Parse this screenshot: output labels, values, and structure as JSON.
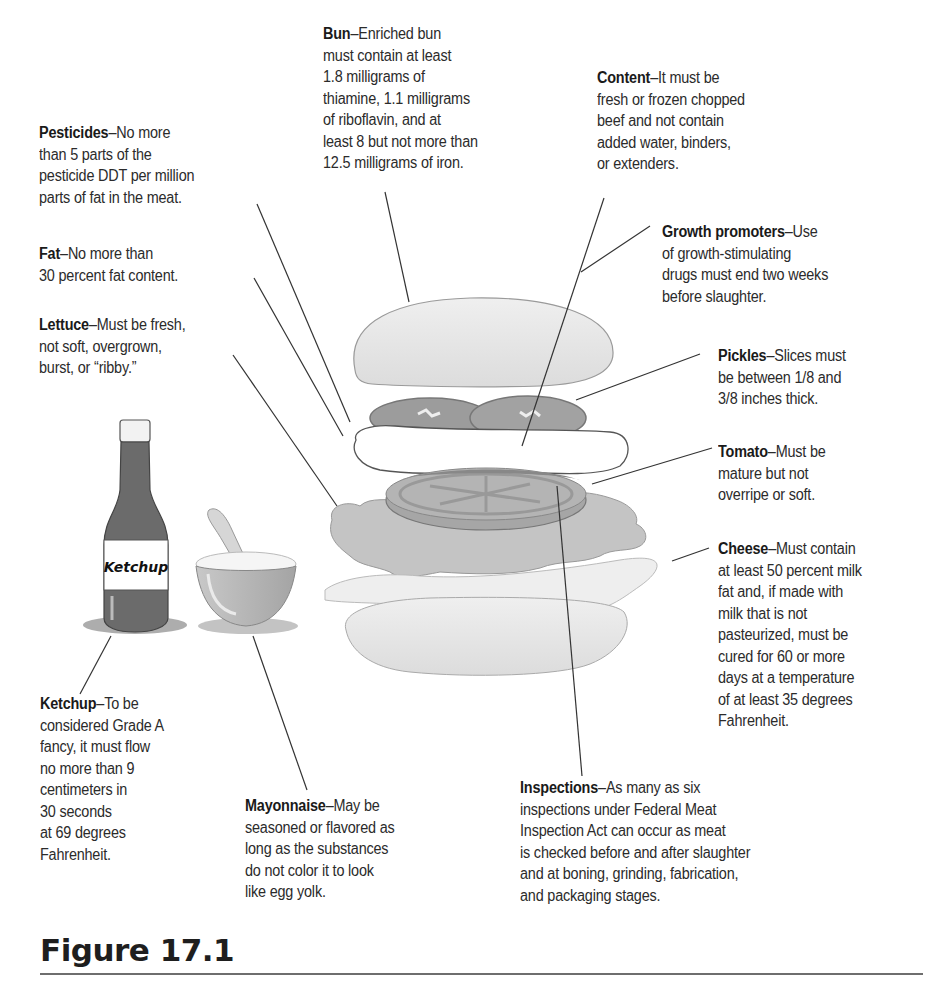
{
  "figure": {
    "title": "Figure 17.1",
    "colors": {
      "bun": "#e6e6e6",
      "patty_outline": "#555555",
      "pickle": "#9a9a9a",
      "tomato": "#a0a0a0",
      "lettuce": "#c4c4c4",
      "cheese": "#eeeeee",
      "ketchup_bottle": "#6b6b6b",
      "mayo_bowl": "#b4b4b4",
      "rule": "#6e6e6e"
    },
    "illustration": {
      "bottle_label": "Ketchup"
    }
  },
  "callouts": {
    "bun": {
      "title": "Bun",
      "sep": "–",
      "lines": [
        "Enriched bun",
        "must contain at least",
        "1.8 milligrams of",
        "thiamine, 1.1 milligrams",
        "of riboflavin, and at",
        "least 8 but not more than",
        "12.5 milligrams of iron."
      ]
    },
    "content": {
      "title": "Content",
      "sep": "–",
      "lines": [
        "It must be",
        "fresh or frozen chopped",
        "beef and not contain",
        "added water, binders,",
        "or extenders."
      ]
    },
    "pesticides": {
      "title": "Pesticides",
      "sep": "–",
      "lines": [
        "No more",
        "than 5 parts of the",
        "pesticide DDT per million",
        "parts of fat in the meat."
      ]
    },
    "fat": {
      "title": "Fat",
      "sep": "–",
      "lines": [
        "No more than",
        "30 percent fat content."
      ]
    },
    "lettuce": {
      "title": "Lettuce",
      "sep": "–",
      "lines": [
        "Must be fresh,",
        "not soft, overgrown,",
        "burst, or “ribby.”"
      ]
    },
    "growth": {
      "title": "Growth promoters",
      "sep": "–",
      "lines": [
        "Use",
        "of growth-stimulating",
        "drugs must end two weeks",
        "before slaughter."
      ]
    },
    "pickles": {
      "title": "Pickles",
      "sep": "–",
      "lines": [
        "Slices must",
        "be between 1/8 and",
        "3/8 inches thick."
      ]
    },
    "tomato": {
      "title": "Tomato",
      "sep": "–",
      "lines": [
        "Must be",
        "mature but not",
        "overripe or soft."
      ]
    },
    "cheese": {
      "title": "Cheese",
      "sep": "–",
      "lines": [
        "Must contain",
        "at least 50 percent milk",
        "fat and, if made with",
        "milk that is not",
        "pasteurized, must be",
        "cured for 60 or more",
        "days at a temperature",
        "of at least 35 degrees",
        "Fahrenheit."
      ]
    },
    "ketchup": {
      "title": "Ketchup",
      "sep": "–",
      "lines": [
        "To be",
        "considered Grade A",
        "fancy, it must flow",
        "no more than 9",
        "centimeters in",
        "30 seconds",
        "at 69 degrees",
        "Fahrenheit."
      ]
    },
    "mayonnaise": {
      "title": "Mayonnaise",
      "sep": "–",
      "lines": [
        "May be",
        "seasoned or flavored as",
        "long as the substances",
        "do not color it to look",
        "like egg yolk."
      ]
    },
    "inspections": {
      "title": "Inspections",
      "sep": "–",
      "lines": [
        "As many as six",
        "inspections under Federal Meat",
        "Inspection Act can occur as meat",
        "is checked before and after slaughter",
        "and at boning, grinding, fabrication,",
        "and packaging stages."
      ]
    }
  }
}
